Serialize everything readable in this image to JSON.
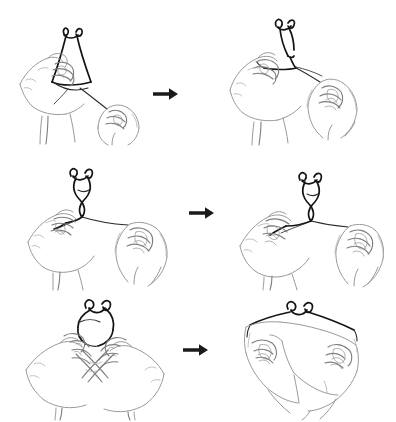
{
  "figure": {
    "background_color": "#ffffff",
    "line_color": "#9a9a9a",
    "cord_color": "#141414",
    "arrow_color": "#1a1a1a",
    "width": 396,
    "height": 422,
    "columns": 2,
    "rows": 3
  },
  "panels": [
    {
      "id": "panel-1",
      "step": "1",
      "row": 1,
      "column": 1,
      "caption": "Left hand pinches the cord while the right hand draws the free end downward, opening a long loop.",
      "icon": "hands-holding-cord-loop"
    },
    {
      "id": "panel-2",
      "step": "2",
      "row": 1,
      "column": 2,
      "caption": "The loop is pulled taut; the crossing point is drawn in toward the left fingertips.",
      "icon": "hands-tightening-cord-loop"
    },
    {
      "id": "panel-3",
      "step": "3",
      "row": 2,
      "column": 1,
      "caption": "Both hands hold the cord level, the twisted loop standing above the pinch point.",
      "icon": "hands-holding-twisted-loop"
    },
    {
      "id": "panel-4",
      "step": "4",
      "row": 2,
      "column": 2,
      "caption": "The cord is stretched between the two hands, narrowing the twist into a small knot.",
      "icon": "hands-stretching-cord"
    },
    {
      "id": "panel-5",
      "step": "5",
      "row": 3,
      "column": 1,
      "caption": "The hands cross, fingers interlaced, with the cord looped over the crossed fingers.",
      "icon": "crossed-hands-with-loop"
    },
    {
      "id": "panel-6",
      "step": "6",
      "row": 3,
      "column": 2,
      "caption": "Seen from above, the finished loop is spread wide across the backs of both hands.",
      "icon": "hands-overhead-finished-loop"
    }
  ],
  "arrows": [
    {
      "id": "arrow-1",
      "row": 1,
      "label": "next step",
      "direction": "right",
      "icon": "arrow-right-icon"
    },
    {
      "id": "arrow-2",
      "row": 2,
      "label": "next step",
      "direction": "right",
      "icon": "arrow-right-icon"
    },
    {
      "id": "arrow-3",
      "row": 3,
      "label": "next step",
      "direction": "right",
      "icon": "arrow-right-icon"
    }
  ]
}
